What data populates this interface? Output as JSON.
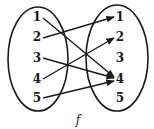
{
  "diagram": {
    "type": "function-mapping",
    "function_label": "f",
    "domain": [
      "1",
      "2",
      "3",
      "4",
      "5"
    ],
    "codomain": [
      "1",
      "2",
      "3",
      "4",
      "5"
    ],
    "mappings": [
      {
        "from": "1",
        "to": "4"
      },
      {
        "from": "2",
        "to": "1"
      },
      {
        "from": "3",
        "to": "4"
      },
      {
        "from": "4",
        "to": "2"
      },
      {
        "from": "5",
        "to": "4"
      }
    ],
    "colors": {
      "stroke": "#1a1a1a",
      "background": "#ffffff"
    }
  }
}
